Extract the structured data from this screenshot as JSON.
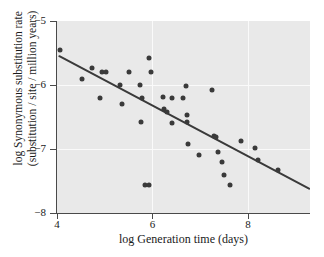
{
  "chart_data": {
    "type": "scatter",
    "title": "",
    "xlabel": "log Generation time (days)",
    "ylabel_line1": "log Synonymous substitution rate",
    "ylabel_line2": "(substitution / site / million years)",
    "xlim": [
      4,
      9.3
    ],
    "ylim": [
      -8,
      -5
    ],
    "xticks": [
      4,
      6,
      8
    ],
    "xticklabels": [
      "4",
      "6",
      "8"
    ],
    "yticks": [
      -5,
      -6,
      -7,
      -8
    ],
    "yticklabels": [
      "−5",
      "−6",
      "−7",
      "−8"
    ],
    "grid": true,
    "gridlines_x": [
      6,
      8
    ],
    "gridlines_y": [
      -6,
      -7
    ],
    "legend": null,
    "marker_color": "#3a3a3a",
    "panel_color": "#e9e9e9",
    "grid_color": "#fafafa",
    "axis_color": "#4a4a4a",
    "points": [
      {
        "x": 4.07,
        "y": -5.45
      },
      {
        "x": 4.52,
        "y": -5.91
      },
      {
        "x": 4.73,
        "y": -5.73
      },
      {
        "x": 4.95,
        "y": -5.79
      },
      {
        "x": 5.02,
        "y": -5.79
      },
      {
        "x": 4.91,
        "y": -6.21
      },
      {
        "x": 5.33,
        "y": -6.0
      },
      {
        "x": 5.36,
        "y": -6.3
      },
      {
        "x": 5.5,
        "y": -5.8
      },
      {
        "x": 5.74,
        "y": -6.0
      },
      {
        "x": 5.79,
        "y": -6.2
      },
      {
        "x": 5.77,
        "y": -6.58
      },
      {
        "x": 5.84,
        "y": -7.56
      },
      {
        "x": 5.92,
        "y": -7.57
      },
      {
        "x": 5.93,
        "y": -5.58
      },
      {
        "x": 5.97,
        "y": -5.79
      },
      {
        "x": 6.22,
        "y": -6.18
      },
      {
        "x": 6.25,
        "y": -6.38
      },
      {
        "x": 6.3,
        "y": -6.42
      },
      {
        "x": 6.41,
        "y": -6.2
      },
      {
        "x": 6.4,
        "y": -6.59
      },
      {
        "x": 6.63,
        "y": -6.21
      },
      {
        "x": 6.7,
        "y": -6.02
      },
      {
        "x": 6.73,
        "y": -6.47
      },
      {
        "x": 6.72,
        "y": -6.58
      },
      {
        "x": 6.74,
        "y": -6.92
      },
      {
        "x": 6.97,
        "y": -7.1
      },
      {
        "x": 7.24,
        "y": -6.08
      },
      {
        "x": 7.28,
        "y": -6.79
      },
      {
        "x": 7.33,
        "y": -6.82
      },
      {
        "x": 7.38,
        "y": -7.04
      },
      {
        "x": 7.46,
        "y": -7.21
      },
      {
        "x": 7.5,
        "y": -7.4
      },
      {
        "x": 7.62,
        "y": -7.56
      },
      {
        "x": 7.85,
        "y": -6.87
      },
      {
        "x": 8.15,
        "y": -6.98
      },
      {
        "x": 8.22,
        "y": -7.17
      },
      {
        "x": 8.64,
        "y": -7.33
      }
    ],
    "regression_line": {
      "x_start": 4.05,
      "y_start": -5.55,
      "x_end": 9.28,
      "y_end": -7.62,
      "color": "#3a3a3a",
      "width": 2
    }
  }
}
